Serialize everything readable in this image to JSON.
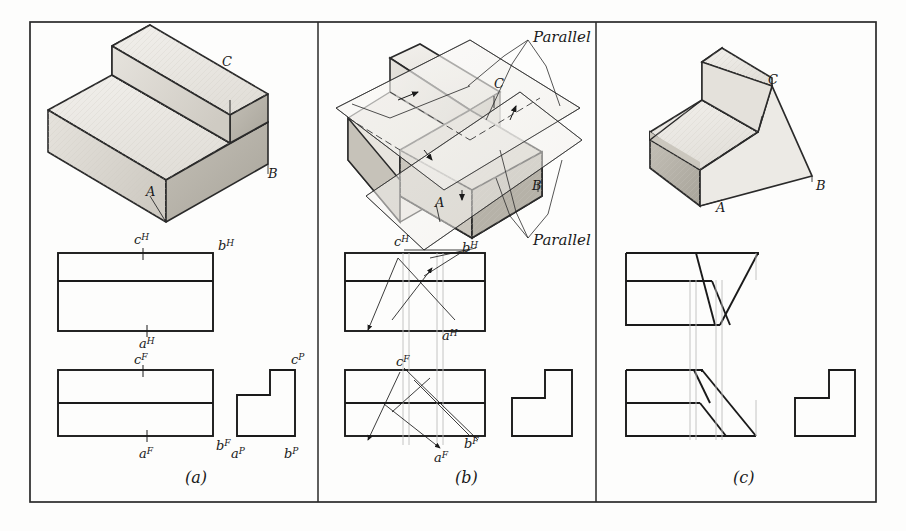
{
  "figure": {
    "type": "descriptive-geometry-plate",
    "background_color": "#fdfdfc",
    "ink_color": "#1a1a1a",
    "construction_color": "#b9b9b9",
    "shade_color": "#d8d5d0"
  },
  "frame": {
    "name": "outer-border",
    "x": 30,
    "y": 22,
    "width": 846,
    "height": 480,
    "dividers": [
      318,
      596
    ]
  },
  "panels": [
    {
      "id": "a",
      "caption": "(a)",
      "caption_x": 185,
      "caption_y": 483,
      "pictorial": {
        "name": "stepped-block-pictorial",
        "vertex_labels": [
          {
            "text": "C",
            "x": 222,
            "y": 66
          },
          {
            "text": "A",
            "x": 146,
            "y": 196
          },
          {
            "text": "B",
            "x": 268,
            "y": 178
          }
        ]
      },
      "views": [
        {
          "name": "top-view",
          "type": "H",
          "labels": [
            {
              "text": "c",
              "sup": "H",
              "x": 143,
              "y": 238
            },
            {
              "text": "b",
              "sup": "H",
              "x": 209,
              "y": 243
            },
            {
              "text": "a",
              "sup": "H",
              "x": 147,
              "y": 338
            }
          ]
        },
        {
          "name": "front-view",
          "type": "F",
          "labels": [
            {
              "text": "c",
              "sup": "F",
              "x": 143,
              "y": 361
            },
            {
              "text": "b",
              "sup": "F",
              "x": 210,
              "y": 442
            },
            {
              "text": "a",
              "sup": "F",
              "x": 147,
              "y": 452
            }
          ]
        },
        {
          "name": "profile-view",
          "type": "P",
          "labels": [
            {
              "text": "c",
              "sup": "P",
              "x": 295,
              "y": 361
            },
            {
              "text": "a",
              "sup": "P",
              "x": 237,
              "y": 452
            },
            {
              "text": "b",
              "sup": "P",
              "x": 290,
              "y": 452
            }
          ]
        }
      ]
    },
    {
      "id": "b",
      "caption": "(b)",
      "caption_x": 455,
      "caption_y": 483,
      "pictorial": {
        "name": "cutting-plane-pictorial",
        "vertex_labels": [
          {
            "text": "C",
            "x": 494,
            "y": 88
          },
          {
            "text": "A",
            "x": 435,
            "y": 207
          },
          {
            "text": "B",
            "x": 532,
            "y": 190
          }
        ],
        "annotations": [
          {
            "text": "Parallel",
            "x": 533,
            "y": 42,
            "name": "parallel-label-top"
          },
          {
            "text": "Parallel",
            "x": 533,
            "y": 240,
            "name": "parallel-label-bottom"
          }
        ]
      },
      "views": [
        {
          "name": "top-view",
          "type": "H",
          "labels": [
            {
              "text": "c",
              "sup": "H",
              "x": 403,
              "y": 240
            },
            {
              "text": "b",
              "sup": "H",
              "x": 466,
              "y": 245
            },
            {
              "text": "a",
              "sup": "H",
              "x": 450,
              "y": 330
            }
          ]
        },
        {
          "name": "front-view",
          "type": "F",
          "labels": [
            {
              "text": "c",
              "sup": "F",
              "x": 404,
              "y": 363
            },
            {
              "text": "b",
              "sup": "F",
              "x": 468,
              "y": 442
            },
            {
              "text": "a",
              "sup": "F",
              "x": 442,
              "y": 455
            }
          ]
        },
        {
          "name": "profile-view",
          "type": "P",
          "labels": []
        }
      ]
    },
    {
      "id": "c",
      "caption": "(c)",
      "caption_x": 733,
      "caption_y": 483,
      "pictorial": {
        "name": "truncated-solid-pictorial",
        "vertex_labels": [
          {
            "text": "C",
            "x": 768,
            "y": 84
          },
          {
            "text": "A",
            "x": 722,
            "y": 208
          },
          {
            "text": "B",
            "x": 814,
            "y": 186
          }
        ]
      },
      "views": [
        {
          "name": "top-view",
          "type": "H",
          "labels": []
        },
        {
          "name": "front-view",
          "type": "F",
          "labels": []
        },
        {
          "name": "profile-view",
          "type": "P",
          "labels": []
        }
      ]
    }
  ]
}
